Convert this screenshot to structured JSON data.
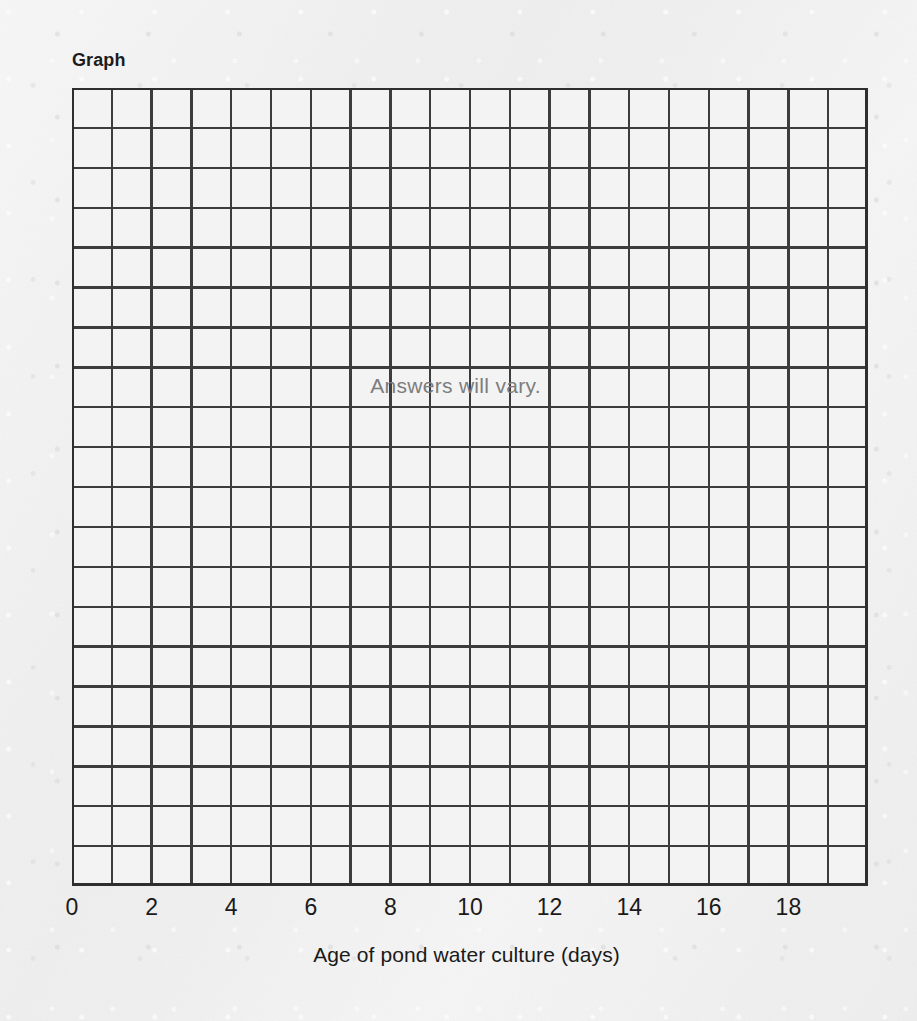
{
  "page": {
    "background_color": "#efefef",
    "ink_color": "#1a1a1a"
  },
  "graph": {
    "title": "Graph",
    "overlay_note": "Answers will vary."
  },
  "chart_data": {
    "type": "scatter",
    "title": "Graph",
    "xlabel": "Age of pond water culture (days)",
    "ylabel": "",
    "annotations": [
      "Answers will vary."
    ],
    "x": [],
    "values": [],
    "series": [],
    "xlim": [
      0,
      20
    ],
    "ylim": [
      0,
      20
    ],
    "xticks": [
      0,
      2,
      4,
      6,
      8,
      10,
      12,
      14,
      16,
      18
    ],
    "xtick_labels": [
      "0",
      "2",
      "4",
      "6",
      "8",
      "10",
      "12",
      "14",
      "16",
      "18"
    ],
    "yticks": [],
    "ytick_labels": [],
    "grid": true,
    "grid_columns": 20,
    "grid_rows": 20,
    "grid_line_color": "#3c3c3c",
    "grid_cell_fill": "#f3f3f3",
    "legend": null,
    "legend_position": "none",
    "note": "Blank 20x20 grid provided for the student to plot their own data; no data points are drawn."
  },
  "axes": {
    "x": {
      "title": "Age of pond water culture (days)",
      "ticks": [
        {
          "label": "0",
          "value": 0
        },
        {
          "label": "2",
          "value": 2
        },
        {
          "label": "4",
          "value": 4
        },
        {
          "label": "6",
          "value": 6
        },
        {
          "label": "8",
          "value": 8
        },
        {
          "label": "10",
          "value": 10
        },
        {
          "label": "12",
          "value": 12
        },
        {
          "label": "14",
          "value": 14
        },
        {
          "label": "16",
          "value": 16
        },
        {
          "label": "18",
          "value": 18
        }
      ]
    }
  }
}
